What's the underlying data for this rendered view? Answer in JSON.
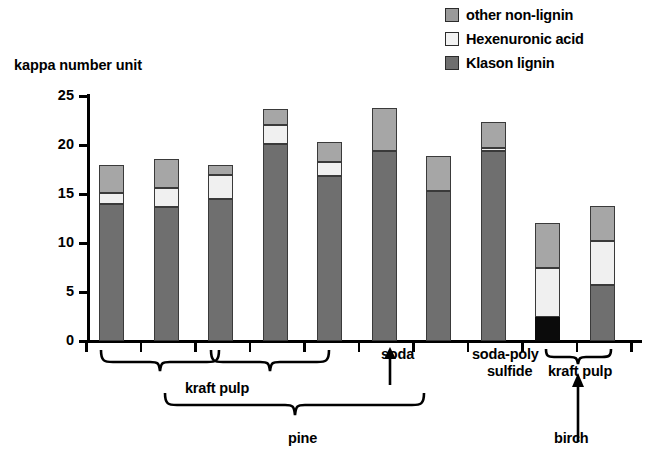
{
  "chart_data": {
    "type": "bar",
    "subtype": "stacked-bar",
    "title": "",
    "xlabel": "",
    "ylabel": "kappa number unit",
    "ylim": [
      0,
      25
    ],
    "yticks": [
      0,
      5,
      10,
      15,
      20,
      25
    ],
    "grid": false,
    "legend_position": "top-right",
    "categories": [
      "1",
      "2",
      "3",
      "4",
      "5",
      "6",
      "7",
      "8",
      "9",
      "10"
    ],
    "series": [
      {
        "name": "Klason lignin",
        "color": "#6f6f6f",
        "values": [
          14.0,
          13.7,
          14.5,
          20.1,
          16.8,
          19.4,
          15.3,
          19.4,
          0.0,
          5.7
        ]
      },
      {
        "name": "Hexenuronic acid",
        "color": "#f0f0f0",
        "values": [
          1.1,
          1.9,
          2.4,
          1.9,
          1.5,
          0.0,
          0.0,
          0.3,
          5.0,
          4.5
        ]
      },
      {
        "name": "other non-lignin",
        "color": "#a6a6a6",
        "values": [
          2.9,
          3.0,
          1.1,
          1.7,
          2.0,
          4.4,
          3.6,
          2.7,
          4.5,
          3.6
        ]
      },
      {
        "name": "black segment",
        "color": "#0b0b0b",
        "values": [
          0.0,
          0.0,
          0.0,
          0.0,
          0.0,
          0.0,
          0.0,
          0.0,
          2.5,
          0.0
        ]
      }
    ],
    "totals": [
      18.0,
      18.6,
      18.0,
      23.7,
      20.3,
      23.8,
      18.9,
      22.4,
      12.0,
      13.8
    ],
    "annotations": [
      "kraft pulp",
      "soda",
      "soda-poly sulfide",
      "pine",
      "kraft pulp",
      "birch"
    ]
  },
  "legend": {
    "items": [
      {
        "label": "other non-lignin",
        "swatch": "other-non-lignin-swatch"
      },
      {
        "label": "Hexenuronic acid",
        "swatch": "hexenuronic-acid-swatch"
      },
      {
        "label": "Klason lignin",
        "swatch": "klason-lignin-swatch"
      }
    ]
  },
  "axis": {
    "y_title": "kappa number unit",
    "y_tick_labels": [
      "25",
      "20",
      "15",
      "10",
      "5",
      "0"
    ]
  },
  "annotations": {
    "kraft_pulp_pine": "kraft pulp",
    "soda": "soda",
    "soda_poly_sulfide_line1": "soda-poly",
    "soda_poly_sulfide_line2": "sulfide",
    "pine": "pine",
    "kraft_pulp_birch": "kraft pulp",
    "birch": "birch"
  }
}
